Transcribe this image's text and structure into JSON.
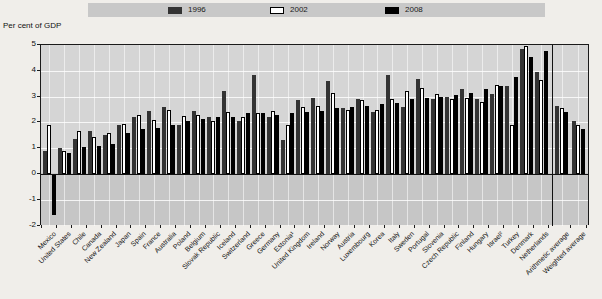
{
  "unit_label": "Per cent of GDP",
  "legend": {
    "items": [
      {
        "label": "1996",
        "color": "#333333",
        "fill": "dark"
      },
      {
        "label": "2002",
        "color": "#ffffff",
        "fill": "white-outline"
      },
      {
        "label": "2008",
        "color": "#000000",
        "fill": "black"
      }
    ]
  },
  "chart_data": {
    "type": "bar",
    "title": "",
    "ylabel": "Per cent of GDP",
    "xlabel": "",
    "ylim": [
      -2,
      5
    ],
    "yticks": [
      5,
      4,
      3,
      2,
      1,
      0,
      -1,
      -2
    ],
    "grid": "horizontal-and-vertical-white",
    "legend_position": "top-band",
    "separator_before_index": 34,
    "categories": [
      "Mexico",
      "United States",
      "Chile",
      "Canada",
      "New Zealand",
      "Japan",
      "Spain",
      "France",
      "Australia",
      "Poland",
      "Belgium",
      "Slovak Republic",
      "Iceland",
      "Switzerland",
      "Greece",
      "Germany",
      "Estonia¹",
      "United Kingdom",
      "Ireland",
      "Norway",
      "Austria",
      "Luxembourg",
      "Korea",
      "Italy",
      "Sweden",
      "Portugal",
      "Slovenia",
      "Czech Republic",
      "Finland",
      "Hungary",
      "Israel²",
      "Turkey",
      "Denmark",
      "Netherlands",
      "Arithmetic average",
      "Weighted average"
    ],
    "series": [
      {
        "name": "1996",
        "values": [
          0.9,
          1.0,
          1.35,
          1.65,
          1.5,
          1.9,
          2.2,
          2.45,
          2.6,
          1.9,
          2.45,
          2.2,
          3.2,
          2.05,
          3.85,
          2.2,
          1.3,
          2.85,
          2.95,
          3.6,
          2.55,
          2.9,
          2.4,
          3.85,
          2.6,
          3.7,
          2.9,
          3.0,
          3.3,
          2.9,
          3.1,
          3.4,
          4.85,
          3.95,
          2.65,
          2.05
        ]
      },
      {
        "name": "2002",
        "values": [
          1.9,
          0.9,
          1.65,
          1.45,
          1.6,
          1.95,
          2.3,
          2.1,
          2.5,
          2.25,
          2.3,
          2.05,
          2.4,
          2.2,
          2.35,
          2.45,
          1.9,
          2.6,
          2.65,
          3.15,
          2.5,
          2.85,
          2.5,
          2.9,
          3.2,
          3.35,
          3.1,
          2.9,
          2.95,
          2.8,
          3.45,
          1.9,
          4.95,
          3.65,
          2.55,
          1.9
        ]
      },
      {
        "name": "2008",
        "values": [
          -1.6,
          0.8,
          1.05,
          1.1,
          1.15,
          1.6,
          1.75,
          1.8,
          1.9,
          2.05,
          2.15,
          2.2,
          2.2,
          2.35,
          2.35,
          2.3,
          2.35,
          2.4,
          2.45,
          2.55,
          2.6,
          2.65,
          2.7,
          2.75,
          2.9,
          2.95,
          3.0,
          3.05,
          3.15,
          3.3,
          3.4,
          3.75,
          4.55,
          4.75,
          2.4,
          1.75
        ]
      }
    ]
  }
}
